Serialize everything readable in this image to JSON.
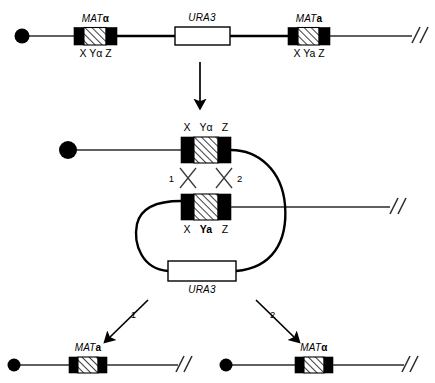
{
  "figure": {
    "colors": {
      "ink": "#000000",
      "line": "#2b2b2b",
      "paper": "#ffffff"
    }
  },
  "top_chromosome": {
    "name": "parent-chromosome",
    "centromere_icon": "centromere-dot",
    "break_icon": "double-slash-break",
    "loci": [
      {
        "id": "mat-alpha",
        "gene_label": "MAT",
        "gene_suffix": "α",
        "segments": "X Yα Z",
        "seg_x": "X",
        "seg_y": "Yα",
        "seg_z": "Z"
      },
      {
        "id": "ura3",
        "gene_label": "URA3"
      },
      {
        "id": "mat-a",
        "gene_label": "MAT",
        "gene_suffix": "a",
        "segments": "X Ya Z",
        "seg_x": "X",
        "seg_y": "Ya",
        "seg_z": "Z"
      }
    ]
  },
  "transition_arrow": {
    "name": "downward-arrow",
    "label": ""
  },
  "middle": {
    "name": "synapsed-recombination-intermediate",
    "upper_cassette": {
      "seg_x": "X",
      "seg_y": "Yα",
      "seg_z": "Z",
      "segments": "X Yα Z"
    },
    "lower_cassette": {
      "seg_x": "X",
      "seg_y": "Ya",
      "seg_z": "Z",
      "segments": "X Ya Z"
    },
    "crossovers": [
      {
        "id": "crossover-1",
        "label": "1"
      },
      {
        "id": "crossover-2",
        "label": "2"
      }
    ],
    "loop_gene": {
      "id": "ura3-loop",
      "gene_label": "URA3"
    },
    "centromere_icon": "centromere-dot",
    "break_icon": "double-slash-break"
  },
  "outcomes": [
    {
      "id": "outcome-1",
      "arrow_label": "1",
      "gene_label": "MAT",
      "gene_suffix": "a",
      "centromere_icon": "centromere-dot",
      "break_icon": "double-slash-break"
    },
    {
      "id": "outcome-2",
      "arrow_label": "2",
      "gene_label": "MAT",
      "gene_suffix": "α",
      "centromere_icon": "centromere-dot",
      "break_icon": "double-slash-break"
    }
  ]
}
